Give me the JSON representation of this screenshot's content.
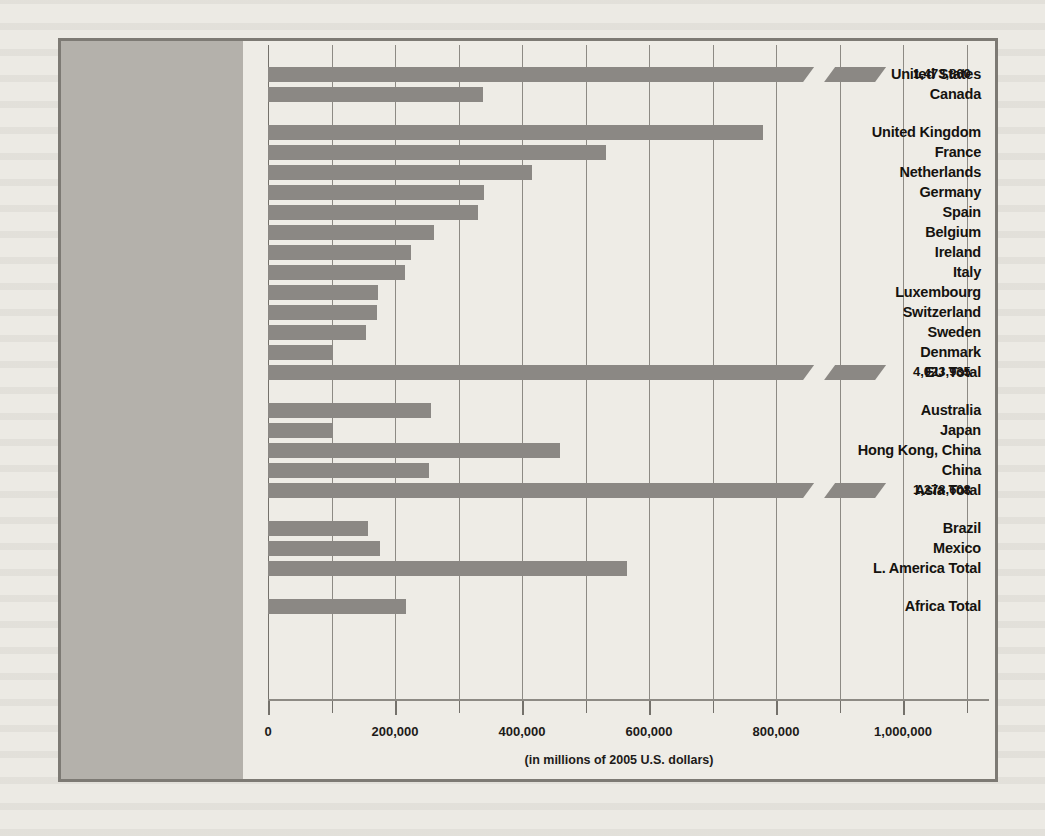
{
  "colors": {
    "bar": "#8b8884",
    "gutter": "#b4b1ab",
    "plot_bg": "#eeece6",
    "frame": "#7d7a74",
    "grid": "#8d8a84",
    "text": "#15130f"
  },
  "chart_data": {
    "type": "bar",
    "orientation": "horizontal",
    "title": "",
    "subtitle": "",
    "xlabel": "(in millions of 2005 U.S. dollars)",
    "ylabel": "",
    "xlim": [
      0,
      1100000
    ],
    "grid": true,
    "gridline_interval": 100000,
    "legend": false,
    "tick_labels": [
      "0",
      "200,000",
      "400,000",
      "600,000",
      "800,000",
      "1,000,000"
    ],
    "tick_values": [
      0,
      200000,
      400000,
      600000,
      800000,
      1000000
    ],
    "minor_tick_values": [
      100000,
      300000,
      500000,
      700000,
      900000,
      1100000
    ],
    "categories": [
      "United States",
      "Canada",
      "United Kingdom",
      "France",
      "Netherlands",
      "Germany",
      "Spain",
      "Belgium",
      "Ireland",
      "Italy",
      "Luxembourg",
      "Switzerland",
      "Sweden",
      "Denmark",
      "EU Total",
      "Australia",
      "Japan",
      "Hong Kong, China",
      "China",
      "Asia Total",
      "Brazil",
      "Mexico",
      "L. America Total",
      "Africa Total"
    ],
    "values": [
      1473860,
      338000,
      780000,
      533000,
      416000,
      340000,
      330000,
      262000,
      225000,
      215000,
      174000,
      172000,
      154000,
      102000,
      4023935,
      256000,
      102000,
      460000,
      253000,
      1278608,
      157000,
      177000,
      565000,
      217000
    ],
    "bars": [
      {
        "label": "United States",
        "value": 1473860,
        "value_label": "1,473,860",
        "broken": true,
        "drawn_to": 860000,
        "group": 0
      },
      {
        "label": "Canada",
        "value": 338000,
        "value_label": "",
        "broken": false,
        "drawn_to": 338000,
        "group": 0
      },
      {
        "label": "United Kingdom",
        "value": 780000,
        "value_label": "",
        "broken": false,
        "drawn_to": 780000,
        "group": 1
      },
      {
        "label": "France",
        "value": 533000,
        "value_label": "",
        "broken": false,
        "drawn_to": 533000,
        "group": 1
      },
      {
        "label": "Netherlands",
        "value": 416000,
        "value_label": "",
        "broken": false,
        "drawn_to": 416000,
        "group": 1
      },
      {
        "label": "Germany",
        "value": 340000,
        "value_label": "",
        "broken": false,
        "drawn_to": 340000,
        "group": 1
      },
      {
        "label": "Spain",
        "value": 330000,
        "value_label": "",
        "broken": false,
        "drawn_to": 330000,
        "group": 1
      },
      {
        "label": "Belgium",
        "value": 262000,
        "value_label": "",
        "broken": false,
        "drawn_to": 262000,
        "group": 1
      },
      {
        "label": "Ireland",
        "value": 225000,
        "value_label": "",
        "broken": false,
        "drawn_to": 225000,
        "group": 1
      },
      {
        "label": "Italy",
        "value": 215000,
        "value_label": "",
        "broken": false,
        "drawn_to": 215000,
        "group": 1
      },
      {
        "label": "Luxembourg",
        "value": 174000,
        "value_label": "",
        "broken": false,
        "drawn_to": 174000,
        "group": 1
      },
      {
        "label": "Switzerland",
        "value": 172000,
        "value_label": "",
        "broken": false,
        "drawn_to": 172000,
        "group": 1
      },
      {
        "label": "Sweden",
        "value": 154000,
        "value_label": "",
        "broken": false,
        "drawn_to": 154000,
        "group": 1
      },
      {
        "label": "Denmark",
        "value": 102000,
        "value_label": "",
        "broken": false,
        "drawn_to": 102000,
        "group": 1
      },
      {
        "label": "EU Total",
        "value": 4023935,
        "value_label": "4,023,935",
        "broken": true,
        "drawn_to": 860000,
        "group": 1
      },
      {
        "label": "Australia",
        "value": 256000,
        "value_label": "",
        "broken": false,
        "drawn_to": 256000,
        "group": 2
      },
      {
        "label": "Japan",
        "value": 102000,
        "value_label": "",
        "broken": false,
        "drawn_to": 102000,
        "group": 2
      },
      {
        "label": "Hong Kong, China",
        "value": 460000,
        "value_label": "",
        "broken": false,
        "drawn_to": 460000,
        "group": 2
      },
      {
        "label": "China",
        "value": 253000,
        "value_label": "",
        "broken": false,
        "drawn_to": 253000,
        "group": 2
      },
      {
        "label": "Asia Total",
        "value": 1278608,
        "value_label": "1,278,608",
        "broken": true,
        "drawn_to": 860000,
        "group": 2
      },
      {
        "label": "Brazil",
        "value": 157000,
        "value_label": "",
        "broken": false,
        "drawn_to": 157000,
        "group": 3
      },
      {
        "label": "Mexico",
        "value": 177000,
        "value_label": "",
        "broken": false,
        "drawn_to": 177000,
        "group": 3
      },
      {
        "label": "L. America Total",
        "value": 565000,
        "value_label": "",
        "broken": false,
        "drawn_to": 565000,
        "group": 3
      },
      {
        "label": "Africa Total",
        "value": 217000,
        "value_label": "",
        "broken": false,
        "drawn_to": 217000,
        "group": 4
      }
    ]
  }
}
